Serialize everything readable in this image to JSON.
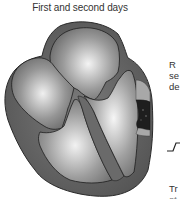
{
  "title": "First and second days",
  "side_text": {
    "line1": "R",
    "line2": "se",
    "line3": "de",
    "line4": "Tr",
    "line5": "st"
  },
  "diagram": {
    "chambers": [
      "left-atrium",
      "right-atrium",
      "left-ventricle",
      "right-ventricle"
    ],
    "highlight": "infarct region on ventricular wall",
    "colors": {
      "outer_wall": "#5a5a5a",
      "chamber_light": "#e8e8e8",
      "chamber_dark": "#707070",
      "infarct_core": "#1a1a1a",
      "infarct_band": "#a8a8a8",
      "outline": "#222222"
    }
  },
  "ecg_icon": "st-elevation-trace"
}
